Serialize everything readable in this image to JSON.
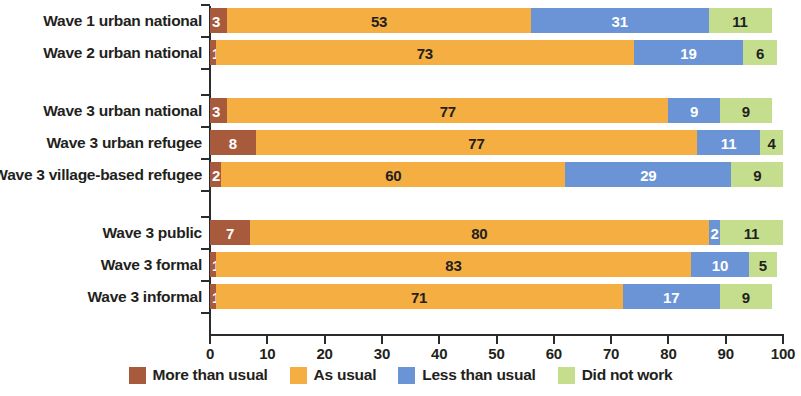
{
  "chart_data": {
    "type": "bar",
    "subtype": "horizontal-stacked-100",
    "title": "",
    "xlabel": "",
    "ylabel": "",
    "xlim": [
      0,
      100
    ],
    "xticks": [
      0,
      10,
      20,
      30,
      40,
      50,
      60,
      70,
      80,
      90,
      100
    ],
    "xtick_labels": [
      "0",
      "10",
      "20",
      "30",
      "40",
      "50",
      "60",
      "70",
      "80",
      "90",
      "100"
    ],
    "grid": false,
    "legend_position": "bottom",
    "categories": [
      "Wave 1 urban national",
      "Wave 2 urban national",
      "Wave 3 urban national",
      "Wave 3 urban refugee",
      "Wave 3 village-based refugee",
      "Wave 3 public",
      "Wave 3 formal",
      "Wave 3 informal"
    ],
    "groups": [
      {
        "rows": [
          0,
          1
        ]
      },
      {
        "rows": [
          2,
          3,
          4
        ]
      },
      {
        "rows": [
          5,
          6,
          7
        ]
      }
    ],
    "series": [
      {
        "name": "More than usual",
        "color": "#A85A3C",
        "label_color": "light",
        "values": [
          3,
          1,
          3,
          8,
          2,
          7,
          1,
          1
        ]
      },
      {
        "name": "As usual",
        "color": "#F4AE42",
        "label_color": "dark",
        "values": [
          53,
          73,
          77,
          77,
          60,
          80,
          83,
          71
        ]
      },
      {
        "name": "Less than usual",
        "color": "#6B94D6",
        "label_color": "light",
        "values": [
          31,
          19,
          9,
          11,
          29,
          2,
          10,
          17
        ]
      },
      {
        "name": "Did not work",
        "color": "#C5DE8E",
        "label_color": "dark",
        "values": [
          11,
          6,
          9,
          4,
          9,
          11,
          5,
          9
        ]
      }
    ]
  },
  "legend": {
    "items": [
      {
        "label": "More than usual",
        "color": "#A85A3C"
      },
      {
        "label": "As usual",
        "color": "#F4AE42"
      },
      {
        "label": "Less than usual",
        "color": "#6B94D6"
      },
      {
        "label": "Did not work",
        "color": "#C5DE8E"
      }
    ]
  },
  "axis": {
    "colors": {
      "spine": "#2b2b2b",
      "text": "#231f20"
    }
  }
}
